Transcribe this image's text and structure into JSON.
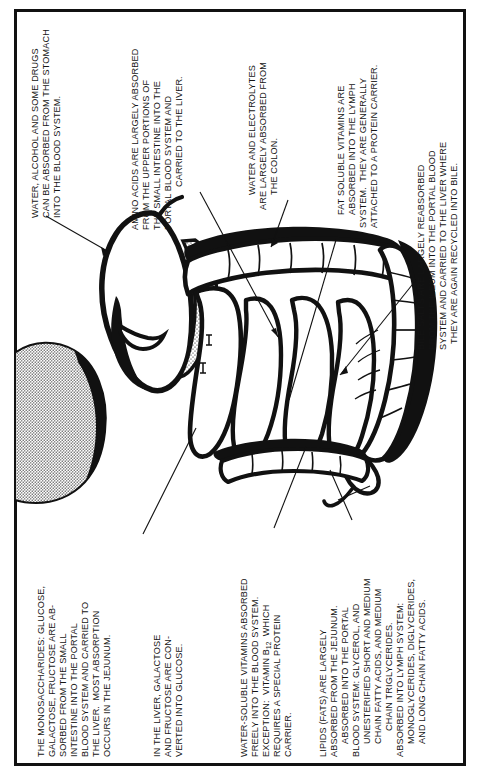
{
  "document": {
    "title": "Sites of Absorption in the Digestive Tract",
    "orientation": "text rotated 90 degrees counter-clockwise",
    "border_color": "#111111",
    "text_color": "#141414",
    "background_color": "#ffffff"
  },
  "annotations": {
    "stomach": {
      "id": "stomach-absorption-note",
      "line1": "WATER, ALCOHOL AND SOME DRUGS",
      "line2": "CAN BE ABSORBED FROM THE STOMACH",
      "line3": "INTO THE BLOOD SYSTEM."
    },
    "amino_acids": {
      "id": "amino-acid-absorption-note",
      "line1": "AMINO ACIDS ARE LARGELY ABSORBED",
      "line2": "FROM THE UPPER PORTIONS OF",
      "line3": "THE SMALL INTESTINE INTO THE",
      "line4": "PORTAL BLOOD SYSTEM AND",
      "line5": "CARRIED TO THE LIVER."
    },
    "water_electrolytes": {
      "id": "water-electrolyte-absorption-note",
      "line1": "WATER AND ELECTROLYTES",
      "line2": "ARE LARGELY ABSORBED FROM",
      "line3": "THE COLON."
    },
    "fat_soluble_vitamins": {
      "id": "fat-soluble-vitamin-absorption-note",
      "line1": "FAT SOLUBLE VITAMINS ARE",
      "line2": "ABSORBED INTO THE LYMPH",
      "line3": "SYSTEM.  THEY ARE GENERALLY",
      "line4": "ATTACHED TO A PROTEIN CARRIER."
    },
    "bile_salts": {
      "id": "bile-salt-absorption-note",
      "line1": "BILE SALTS ARE LARGELY REABSORBED",
      "line2": "FROM THE ILEUM INTO THE PORTAL BLOOD",
      "line3": "SYSTEM AND CARRIED TO THE LIVER WHERE",
      "line4": "THEY ARE AGAIN RECYCLED INTO BILE."
    },
    "monosaccharides": {
      "id": "monosaccharide-absorption-note",
      "line1": "THE MONOSACCHARIDES: GLUCOSE,",
      "line2": "GALACTOSE, FRUCTOSE ARE AB-",
      "line3": "SORBED FROM THE SMALL",
      "line4": "INTESTINE INTO THE PORTAL",
      "line5": "BLOOD SYSTEM AND CARRIED TO",
      "line6": "THE LIVER.  MOST ABSORPTION",
      "line7": "OCCURS IN THE JEJUNUM."
    },
    "liver_conversion": {
      "id": "liver-conversion-note",
      "line1": "IN THE LIVER, GALACTOSE",
      "line2": "AND FRUCTOSE ARE CON-",
      "line3": "VERTED INTO GLUCOSE."
    },
    "water_soluble_vitamins": {
      "id": "water-soluble-vitamin-note",
      "line1": "WATER-SOLUBLE VITAMINS ABSORBED",
      "line2": "FREELY INTO THE BLOOD SYSTEM.",
      "line3a": "EXCEPTION:  VITAMIN B",
      "line3sub": "12",
      "line3b": "  WHICH",
      "line4": "REQUIRES A SPECIAL PROTEIN",
      "line5": "CARRIER."
    },
    "lipids": {
      "id": "lipid-absorption-note",
      "line1": "LIPIDS (FATS) ARE LARGELY",
      "line2": "ABSORBED FROM THE JEJUNUM.",
      "line3": "ABSORBED INTO THE PORTAL",
      "line4": "BLOOD SYSTEM: GLYCEROL, AND",
      "line5": "UNESTERIFIED SHORT AND MEDIUM",
      "line6": "CHAIN FATTY ACIDS, AND MEDIUM",
      "line7": "CHAIN TRIGLYCERIDES.",
      "line8": "ABSORBED INTO LYMPH SYSTEM:",
      "line9": "MONOGLYCERIDES, DIGLYCERIDES,",
      "line10": "AND LONG CHAIN FATTY ACIDS."
    }
  },
  "illustration": {
    "name": "digestive-tract-illustration",
    "organs": [
      "stomach",
      "duodenum",
      "jejunum",
      "ileum",
      "colon",
      "cecum",
      "appendix"
    ],
    "style": "black ink line drawing with stippled shading"
  }
}
